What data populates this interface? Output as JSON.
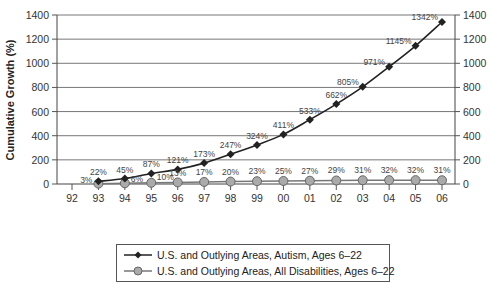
{
  "chart_data": {
    "type": "line",
    "title": "",
    "xlabel": "",
    "ylabel": "Cumulative Growth (%)",
    "ylim": [
      0,
      1400
    ],
    "yticks": [
      0,
      200,
      400,
      600,
      800,
      1000,
      1200,
      1400
    ],
    "y2ticks": [
      0,
      200,
      400,
      600,
      800,
      1000,
      1200,
      1400
    ],
    "grid": true,
    "legend_position": "bottom",
    "categories": [
      "92",
      "93",
      "94",
      "95",
      "96",
      "97",
      "98",
      "99",
      "00",
      "01",
      "02",
      "03",
      "04",
      "05",
      "06"
    ],
    "series": [
      {
        "name": "U.S. and Outlying Areas, Autism, Ages 6–22",
        "marker": "diamond",
        "color": "#222222",
        "values": [
          null,
          22,
          45,
          87,
          121,
          173,
          247,
          324,
          411,
          533,
          662,
          805,
          971,
          1145,
          1342
        ],
        "labels": [
          "",
          "22%",
          "45%",
          "87%",
          "121%",
          "173%",
          "247%",
          "324%",
          "411%",
          "533%",
          "662%",
          "805%",
          "971%",
          "1145%",
          "1342%"
        ]
      },
      {
        "name": "U.S. and Outlying Areas, All Disabilities, Ages 6–22",
        "marker": "circle",
        "color": "#aaaaaa",
        "values": [
          null,
          3,
          6,
          10,
          13,
          17,
          20,
          23,
          25,
          27,
          29,
          31,
          32,
          32,
          31
        ],
        "labels": [
          "",
          "3%",
          "6%",
          "10%",
          "13%",
          "17%",
          "20%",
          "23%",
          "25%",
          "27%",
          "29%",
          "31%",
          "32%",
          "32%",
          "31%"
        ]
      }
    ]
  }
}
